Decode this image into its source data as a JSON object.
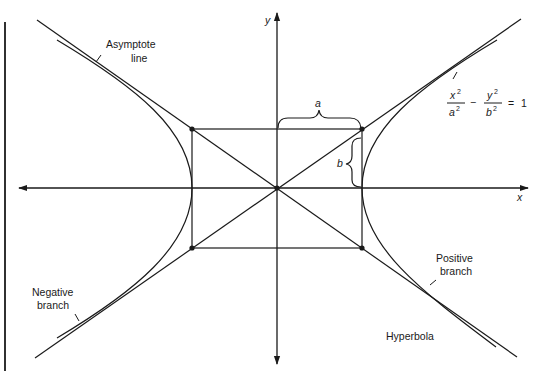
{
  "diagram": {
    "title": "Hyperbola",
    "colors": {
      "ink": "#1a1a1a",
      "background": "#ffffff"
    },
    "axes": {
      "x_label": "x",
      "y_label": "y"
    },
    "parameters": {
      "a_label": "a",
      "b_label": "b"
    },
    "equation": {
      "x_num": "x",
      "x_den": "a",
      "y_num": "y",
      "y_den": "b",
      "exp": "2",
      "minus": "−",
      "equals": "=",
      "rhs": "1"
    },
    "annotations": {
      "asymptote_line_1": "Asymptote",
      "asymptote_line_2": "line",
      "negative_branch_1": "Negative",
      "negative_branch_2": "branch",
      "positive_branch_1": "Positive",
      "positive_branch_2": "branch",
      "caption": "Hyperbola"
    }
  }
}
